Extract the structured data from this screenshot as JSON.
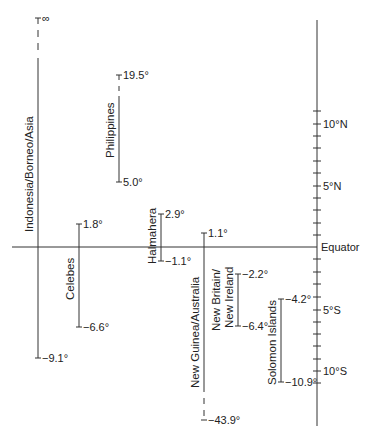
{
  "diagram": {
    "type": "latitude-range-diagram",
    "axis": {
      "equator_label": "Equator",
      "tick_labels": [
        {
          "label": "10°N",
          "lat": 10
        },
        {
          "label": "5°N",
          "lat": 5
        },
        {
          "label": "5°S",
          "lat": -5
        },
        {
          "label": "10°S",
          "lat": -10
        }
      ],
      "tick_step_deg": 1,
      "tick_range": [
        11,
        -11
      ]
    },
    "ranges": [
      {
        "name": "Indonesia/Borneo/Asia",
        "top_label": "∞",
        "bottom_label": "−9.1°",
        "top": "infinity",
        "bottom": -9.1
      },
      {
        "name": "Celebes",
        "top_label": "1.8°",
        "bottom_label": "−6.6°",
        "top": 1.8,
        "bottom": -6.6
      },
      {
        "name": "Philippines",
        "top_label": "19.5°",
        "bottom_label": "5.0°",
        "top": 19.5,
        "bottom": 5.0
      },
      {
        "name": "Halmahera",
        "top_label": "2.9°",
        "bottom_label": "−1.1°",
        "top": 2.9,
        "bottom": -1.1
      },
      {
        "name": "New Guinea/Australia",
        "top_label": "1.1°",
        "bottom_label": "−43.9°",
        "top": 1.1,
        "bottom": -43.9
      },
      {
        "name_line1": "New Britain/",
        "name_line2": "New Ireland",
        "top_label": "−2.2°",
        "bottom_label": "−6.4°",
        "top": -2.2,
        "bottom": -6.4
      },
      {
        "name": "Solomon Islands",
        "top_label": "−4.2°",
        "bottom_label": "−10.9°",
        "top": -4.2,
        "bottom": -10.9
      }
    ]
  }
}
